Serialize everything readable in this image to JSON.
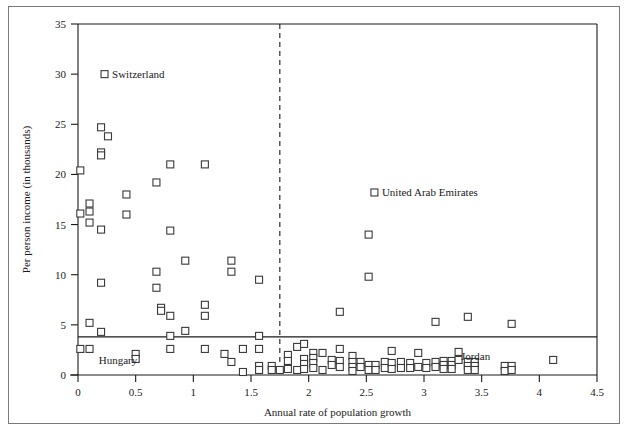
{
  "chart_data": {
    "type": "scatter",
    "title": "",
    "xlabel": "Annual rate of population growth",
    "ylabel": "Per person income (in thousands)",
    "xlim": [
      0,
      4.5
    ],
    "ylim": [
      0,
      35
    ],
    "xticks": [
      "0",
      "0.5",
      "1",
      "1.5",
      "2",
      "2.5",
      "3",
      "3.5",
      "4",
      "4.5"
    ],
    "xtick_values": [
      0,
      0.5,
      1,
      1.5,
      2,
      2.5,
      3,
      3.5,
      4,
      4.5
    ],
    "yticks": [
      "0",
      "5",
      "10",
      "15",
      "20",
      "25",
      "30",
      "35"
    ],
    "ytick_values": [
      0,
      5,
      10,
      15,
      20,
      25,
      30,
      35
    ],
    "grid": false,
    "legend": "none",
    "marker": "open-square",
    "marker_color": "#3a3a3a",
    "marker_fill": "#ffffff",
    "reference_lines": [
      {
        "orientation": "horizontal",
        "value": 3.8,
        "style": "solid",
        "name": "income-threshold-line"
      },
      {
        "orientation": "vertical",
        "value": 1.75,
        "style": "dashed",
        "name": "growth-threshold-line"
      }
    ],
    "annotations": [
      {
        "label": "Switzerland",
        "x": 0.23,
        "y": 30.0,
        "marker": true,
        "anchor": "right",
        "name": "annotation-switzerland"
      },
      {
        "label": "United Arab Emirates",
        "x": 2.57,
        "y": 18.2,
        "marker": true,
        "anchor": "right",
        "name": "annotation-uae"
      },
      {
        "label": "Hungary",
        "x": 0.18,
        "y": 1.45,
        "marker": false,
        "anchor": "right",
        "name": "annotation-hungary"
      },
      {
        "label": "Jordan",
        "x": 3.32,
        "y": 1.9,
        "marker": false,
        "anchor": "right",
        "name": "annotation-jordan"
      }
    ],
    "points": [
      [
        0.02,
        20.4
      ],
      [
        0.02,
        16.1
      ],
      [
        0.02,
        2.6
      ],
      [
        0.1,
        17.1
      ],
      [
        0.1,
        16.3
      ],
      [
        0.1,
        15.2
      ],
      [
        0.1,
        5.2
      ],
      [
        0.1,
        2.6
      ],
      [
        0.2,
        24.7
      ],
      [
        0.2,
        22.2
      ],
      [
        0.2,
        21.9
      ],
      [
        0.2,
        14.5
      ],
      [
        0.2,
        9.2
      ],
      [
        0.2,
        4.3
      ],
      [
        0.26,
        23.8
      ],
      [
        0.42,
        18.0
      ],
      [
        0.42,
        16.0
      ],
      [
        0.5,
        2.1
      ],
      [
        0.5,
        1.6
      ],
      [
        0.68,
        19.2
      ],
      [
        0.68,
        10.3
      ],
      [
        0.68,
        8.7
      ],
      [
        0.72,
        6.7
      ],
      [
        0.72,
        6.4
      ],
      [
        0.8,
        21.0
      ],
      [
        0.8,
        14.4
      ],
      [
        0.8,
        5.9
      ],
      [
        0.8,
        3.9
      ],
      [
        0.8,
        2.6
      ],
      [
        0.93,
        11.4
      ],
      [
        0.93,
        4.4
      ],
      [
        1.1,
        21.0
      ],
      [
        1.1,
        7.0
      ],
      [
        1.1,
        5.9
      ],
      [
        1.1,
        2.6
      ],
      [
        1.27,
        2.1
      ],
      [
        1.33,
        11.4
      ],
      [
        1.33,
        10.3
      ],
      [
        1.33,
        1.3
      ],
      [
        1.43,
        2.6
      ],
      [
        1.43,
        0.3
      ],
      [
        1.57,
        9.5
      ],
      [
        1.57,
        3.9
      ],
      [
        1.57,
        2.6
      ],
      [
        1.57,
        0.9
      ],
      [
        1.57,
        0.5
      ],
      [
        1.68,
        0.9
      ],
      [
        1.68,
        0.5
      ],
      [
        1.75,
        0.5
      ],
      [
        1.82,
        2.0
      ],
      [
        1.82,
        1.4
      ],
      [
        1.82,
        0.6
      ],
      [
        1.9,
        2.8
      ],
      [
        1.9,
        0.5
      ],
      [
        1.96,
        3.1
      ],
      [
        1.96,
        1.6
      ],
      [
        1.96,
        1.1
      ],
      [
        1.96,
        0.6
      ],
      [
        2.04,
        2.2
      ],
      [
        2.04,
        1.7
      ],
      [
        2.04,
        1.2
      ],
      [
        2.04,
        0.7
      ],
      [
        2.12,
        2.2
      ],
      [
        2.12,
        0.5
      ],
      [
        2.2,
        1.5
      ],
      [
        2.2,
        1.0
      ],
      [
        2.27,
        6.3
      ],
      [
        2.27,
        2.6
      ],
      [
        2.27,
        1.4
      ],
      [
        2.27,
        0.8
      ],
      [
        2.38,
        1.9
      ],
      [
        2.38,
        1.3
      ],
      [
        2.38,
        0.8
      ],
      [
        2.38,
        0.4
      ],
      [
        2.45,
        1.3
      ],
      [
        2.45,
        0.8
      ],
      [
        2.52,
        14.0
      ],
      [
        2.52,
        1.0
      ],
      [
        2.52,
        0.5
      ],
      [
        2.58,
        1.0
      ],
      [
        2.58,
        0.5
      ],
      [
        2.66,
        1.3
      ],
      [
        2.66,
        0.7
      ],
      [
        2.72,
        2.4
      ],
      [
        2.72,
        1.2
      ],
      [
        2.72,
        0.6
      ],
      [
        2.8,
        1.3
      ],
      [
        2.8,
        0.7
      ],
      [
        2.52,
        9.8
      ],
      [
        2.88,
        1.2
      ],
      [
        2.88,
        0.7
      ],
      [
        2.95,
        2.2
      ],
      [
        2.95,
        0.8
      ],
      [
        3.02,
        1.2
      ],
      [
        3.02,
        0.7
      ],
      [
        3.1,
        5.3
      ],
      [
        3.1,
        1.3
      ],
      [
        3.1,
        0.8
      ],
      [
        3.17,
        1.4
      ],
      [
        3.17,
        1.0
      ],
      [
        3.17,
        0.6
      ],
      [
        3.24,
        1.4
      ],
      [
        3.24,
        1.0
      ],
      [
        3.24,
        0.6
      ],
      [
        3.3,
        2.3
      ],
      [
        3.3,
        1.5
      ],
      [
        3.38,
        5.8
      ],
      [
        3.38,
        1.3
      ],
      [
        3.38,
        0.9
      ],
      [
        3.38,
        0.5
      ],
      [
        3.44,
        1.3
      ],
      [
        3.44,
        0.9
      ],
      [
        3.44,
        0.5
      ],
      [
        3.7,
        0.9
      ],
      [
        3.7,
        0.4
      ],
      [
        3.76,
        5.1
      ],
      [
        3.76,
        0.9
      ],
      [
        3.76,
        0.5
      ],
      [
        4.12,
        1.5
      ]
    ]
  }
}
